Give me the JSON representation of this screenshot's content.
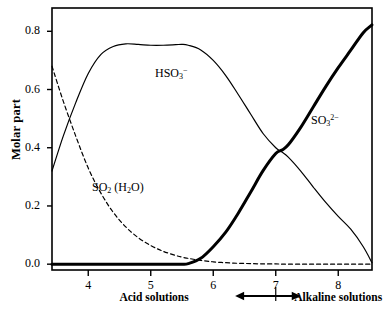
{
  "chart_data": {
    "type": "line",
    "title": "",
    "xlabel": "pH",
    "ylabel": "Molar part",
    "xlim": [
      3.42,
      8.54
    ],
    "ylim": [
      -0.02,
      0.88
    ],
    "grid": false,
    "legend_position": "inline-annotations",
    "xticks": [
      "4",
      "5",
      "6",
      "7",
      "8"
    ],
    "xtick_values": [
      4,
      5,
      6,
      7,
      8
    ],
    "yticks": [
      "0.0",
      "0.2",
      "0.4",
      "0.6",
      "0.8"
    ],
    "ytick_values": [
      0.0,
      0.2,
      0.4,
      0.6,
      0.8
    ],
    "x": [
      3.42,
      3.6,
      3.8,
      4.0,
      4.2,
      4.4,
      4.6,
      4.8,
      5.0,
      5.2,
      5.4,
      5.5,
      5.6,
      5.8,
      6.0,
      6.2,
      6.4,
      6.6,
      6.8,
      7.0,
      7.1,
      7.2,
      7.4,
      7.6,
      7.8,
      8.0,
      8.2,
      8.4,
      8.54
    ],
    "series": [
      {
        "name": "SO2 (H2O)",
        "label_html": "SO<sub>2</sub> (H<sub>2</sub>O)",
        "style": "dashed",
        "linewidth": 1.2,
        "color": "#000000",
        "values": [
          0.68,
          0.56,
          0.44,
          0.33,
          0.245,
          0.178,
          0.128,
          0.091,
          0.064,
          0.044,
          0.03,
          0.024,
          0.02,
          0.013,
          0.008,
          0.005,
          0.003,
          0.002,
          0.001,
          0.001,
          0.0,
          0.0,
          0.0,
          0.0,
          0.0,
          0.0,
          0.0,
          0.0,
          0.0
        ]
      },
      {
        "name": "HSO3-",
        "label_html": "HSO<sub>3</sub><sup>&minus;</sup>",
        "style": "solid",
        "linewidth": 1.2,
        "color": "#000000",
        "values": [
          0.32,
          0.44,
          0.555,
          0.655,
          0.72,
          0.748,
          0.757,
          0.755,
          0.752,
          0.752,
          0.754,
          0.755,
          0.752,
          0.736,
          0.7,
          0.648,
          0.583,
          0.515,
          0.448,
          0.4,
          0.385,
          0.368,
          0.32,
          0.265,
          0.212,
          0.164,
          0.12,
          0.06,
          0.005
        ]
      },
      {
        "name": "SO3 2-",
        "label_html": "SO<sub>3</sub><sup>2&minus;</sup>",
        "style": "solid-bold",
        "linewidth": 3.0,
        "color": "#000000",
        "values": [
          0.0,
          0.0,
          0.0,
          0.0,
          0.0,
          0.0,
          0.0,
          0.0,
          0.0,
          0.0,
          0.0,
          0.0,
          0.002,
          0.02,
          0.06,
          0.11,
          0.175,
          0.248,
          0.322,
          0.38,
          0.392,
          0.41,
          0.47,
          0.54,
          0.61,
          0.675,
          0.735,
          0.795,
          0.822
        ]
      }
    ],
    "annotations": [
      {
        "name": "acid-region",
        "text": "Acid solutions",
        "x_data": 5.05,
        "y_px": 297
      },
      {
        "name": "alkaline-region",
        "text": "Alkaline solutions",
        "x_data": 8.0,
        "y_px": 297
      },
      {
        "name": "ph-divider-arrow",
        "text": "",
        "x_from": 6.35,
        "x_to": 7.4,
        "center_x": 7.0,
        "y_px": 296
      }
    ]
  },
  "axis": {
    "y_title": "Molar part",
    "ytick_labels": [
      "0.8",
      "0.6",
      "0.4",
      "0.2",
      "0.0"
    ],
    "xtick_labels": [
      "4",
      "5",
      "6",
      "7",
      "8"
    ]
  },
  "labels": {
    "hso3": "HSO",
    "hso3_sub": "3",
    "hso3_sup": "−",
    "so3": "SO",
    "so3_sub": "3",
    "so3_sup": "2−",
    "so2": "SO",
    "so2_sub": "2",
    "so2_water_open": " (H",
    "so2_water_sub": "2",
    "so2_water_close": "O)",
    "acid_region": "Acid solutions",
    "alkaline_region": "Alkaline solutions"
  },
  "colors": {
    "line": "#000000",
    "frame": "#000000",
    "background": "#ffffff"
  }
}
